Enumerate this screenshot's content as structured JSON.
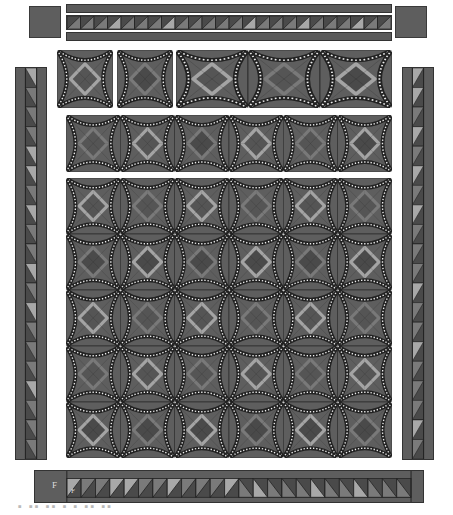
{
  "diagram": {
    "type": "quilt-layout",
    "colors": {
      "background": "#5e5e5e",
      "dark": "#4a4a4a",
      "medium": "#7a7a7a",
      "light": "#a8a8a8",
      "line": "#222222",
      "dots": "#eeeeee"
    },
    "top_border": {
      "corner_squares": 2,
      "strips": 3,
      "triangle_count": 24
    },
    "top_row_blocks": 5,
    "middle_row_blocks": 6,
    "main_grid": {
      "rows": 5,
      "cols": 6
    },
    "side_borders": {
      "left_triangles": 20,
      "right_triangles": 20
    },
    "bottom_border": {
      "label_left": "F",
      "label_inner": "F",
      "triangle_count": 24
    },
    "caption": "▪ ▪▪ ▪▪ ▪ ▪ ▪▪ ▪▪"
  }
}
